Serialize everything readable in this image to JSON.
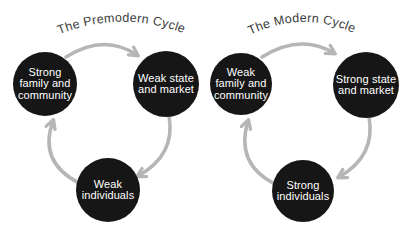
{
  "colors": {
    "background": "#ffffff",
    "node_fill": "#161616",
    "node_text": "#ffffff",
    "arrow": "#b6b6b6",
    "title_text": "#3c3c3c"
  },
  "diagrams": [
    {
      "title": "The Premodern Cycle",
      "nodes": [
        {
          "id": "family-community",
          "label": "Strong family and community",
          "lines": [
            "Strong",
            "family and",
            "community"
          ]
        },
        {
          "id": "state-market",
          "label": "Weak state and market",
          "lines": [
            "Weak state",
            "and market"
          ]
        },
        {
          "id": "individuals",
          "label": "Weak individuals",
          "lines": [
            "Weak",
            "individuals"
          ]
        }
      ],
      "cycle_order": [
        {
          "from": "family-community",
          "to": "state-market"
        },
        {
          "from": "state-market",
          "to": "individuals"
        },
        {
          "from": "individuals",
          "to": "family-community"
        }
      ]
    },
    {
      "title": "The Modern Cycle",
      "nodes": [
        {
          "id": "family-community",
          "label": "Weak family and community",
          "lines": [
            "Weak",
            "family and",
            "community"
          ]
        },
        {
          "id": "state-market",
          "label": "Strong state and market",
          "lines": [
            "Strong state",
            "and market"
          ]
        },
        {
          "id": "individuals",
          "label": "Strong individuals",
          "lines": [
            "Strong",
            "individuals"
          ]
        }
      ],
      "cycle_order": [
        {
          "from": "family-community",
          "to": "state-market"
        },
        {
          "from": "state-market",
          "to": "individuals"
        },
        {
          "from": "individuals",
          "to": "family-community"
        }
      ]
    }
  ]
}
